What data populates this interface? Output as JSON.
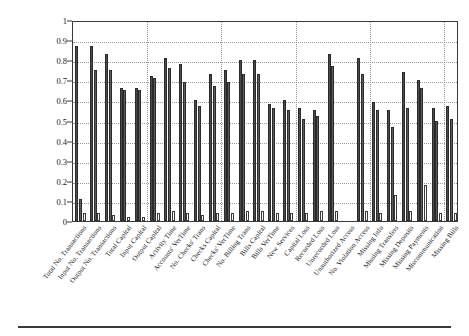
{
  "figure": {
    "y_axis_label": "Correlations to Risks (Gen Pos Neg)"
  },
  "chart_data": {
    "type": "bar",
    "title": "",
    "xlabel": "",
    "ylabel": "Correlations to Risks (Gen Pos Neg)",
    "ylim": [
      0,
      1
    ],
    "yticks": [
      "0",
      "0.1",
      "0.2",
      "0.3",
      "0.4",
      "0.5",
      "0.6",
      "0.7",
      "0.8",
      "0.9",
      "1"
    ],
    "grid": true,
    "legend": "none",
    "bars_per_group": 3,
    "categories": [
      "Total No. Transactions",
      "Input No. Transactions",
      "Output No. Transactions",
      "Total Capital",
      "Input Capital",
      "Output Capital",
      "Activity Time",
      "Accounts' VerTime",
      "No. Checks' Trans",
      "Checks Capital",
      "Checks' VerTime",
      "No. Billing Trans",
      "Bills Capital",
      "Bills VerTime",
      "New Services",
      "Capital Loss",
      "Recorded Loss",
      "Unrecorded Loss",
      "Unauthorized Access",
      "No. Violation Access",
      "Missing Info",
      "Missing Transfers",
      "Missing Deposits",
      "Missing Payments",
      "Miscommunication",
      "Missing Bills"
    ],
    "series": [
      {
        "name": "Series 1",
        "color": "#4a4a4a",
        "values": [
          0.87,
          0.87,
          0.83,
          0.66,
          0.66,
          0.72,
          0.81,
          0.78,
          0.6,
          0.73,
          0.75,
          0.8,
          0.8,
          0.58,
          0.6,
          0.56,
          0.55,
          0.83,
          0.0,
          0.81,
          0.59,
          0.55,
          0.74,
          0.7,
          0.56,
          0.57
        ]
      },
      {
        "name": "Series 2",
        "color": "#5c5c5c",
        "values": [
          0.11,
          0.75,
          0.75,
          0.65,
          0.65,
          0.71,
          0.76,
          0.69,
          0.57,
          0.67,
          0.69,
          0.73,
          0.73,
          0.56,
          0.55,
          0.51,
          0.52,
          0.77,
          0.0,
          0.73,
          0.55,
          0.47,
          0.56,
          0.66,
          0.5,
          0.51
        ]
      },
      {
        "name": "Series 3",
        "color": "#ffffff",
        "values": [
          0.04,
          0.04,
          0.03,
          0.02,
          0.02,
          0.04,
          0.05,
          0.04,
          0.03,
          0.04,
          0.04,
          0.05,
          0.05,
          0.04,
          0.04,
          0.04,
          0.05,
          0.05,
          0.0,
          0.05,
          0.04,
          0.13,
          0.05,
          0.18,
          0.04,
          0.04
        ]
      }
    ]
  }
}
